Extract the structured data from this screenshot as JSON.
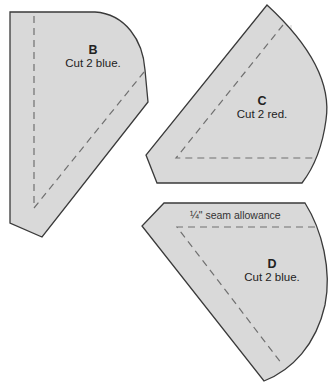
{
  "pieces": [
    {
      "id": "B",
      "letter": "B",
      "instruction": "Cut 2 blue."
    },
    {
      "id": "C",
      "letter": "C",
      "instruction": "Cut 2 red."
    },
    {
      "id": "D",
      "letter": "D",
      "instruction": "Cut 2 blue."
    }
  ],
  "annotations": {
    "seam_allowance": "¼\" seam allowance"
  },
  "colors": {
    "piece_fill": "#d9d9d9",
    "outline": "#3a3a3a",
    "seam_line": "#707070"
  }
}
